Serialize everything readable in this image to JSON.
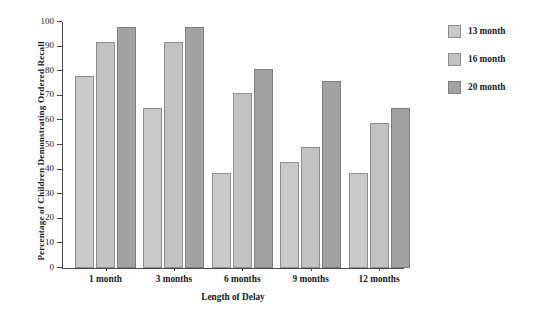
{
  "chart_data": {
    "type": "bar",
    "title": "",
    "xlabel": "Length of Delay",
    "ylabel": "Percentage of Children Demonstrating Ordered Recall",
    "categories": [
      "1 month",
      "3 months",
      "6 months",
      "9 months",
      "12 months"
    ],
    "series": [
      {
        "name": "13 month",
        "color": "#c9c9c9",
        "values": [
          78,
          65,
          38.5,
          43,
          38.5
        ]
      },
      {
        "name": "16 month",
        "color": "#c2c2c2",
        "values": [
          92,
          92,
          71,
          49,
          59
        ]
      },
      {
        "name": "20 month",
        "color": "#a2a2a2",
        "values": [
          98,
          98,
          81,
          76,
          65
        ]
      }
    ],
    "ylim": [
      0,
      100
    ],
    "yticks": [
      0,
      10,
      20,
      30,
      40,
      50,
      60,
      70,
      80,
      90,
      100
    ],
    "ytick_labels": [
      "0",
      "10",
      "20",
      "30",
      "40",
      "50",
      "60",
      "70",
      "80",
      "90",
      "100"
    ],
    "grid": false,
    "legend_position": "right"
  },
  "legend": {
    "items": [
      {
        "label": "13 month"
      },
      {
        "label": "16 month"
      },
      {
        "label": "20 month"
      }
    ]
  }
}
